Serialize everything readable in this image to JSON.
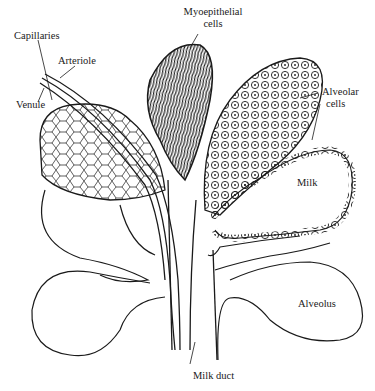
{
  "labels": {
    "capillaries": "Capillaries",
    "arteriole": "Arteriole",
    "venule": "Venule",
    "myoepithelial_line1": "Myoepithelial",
    "myoepithelial_line2": "cells",
    "alveolar_line1": "Alveolar",
    "alveolar_line2": "cells",
    "milk": "Milk",
    "alveolus": "Alveolus",
    "milk_duct": "Milk duct"
  },
  "colors": {
    "ink": "#1a1a1a",
    "background": "#ffffff"
  }
}
